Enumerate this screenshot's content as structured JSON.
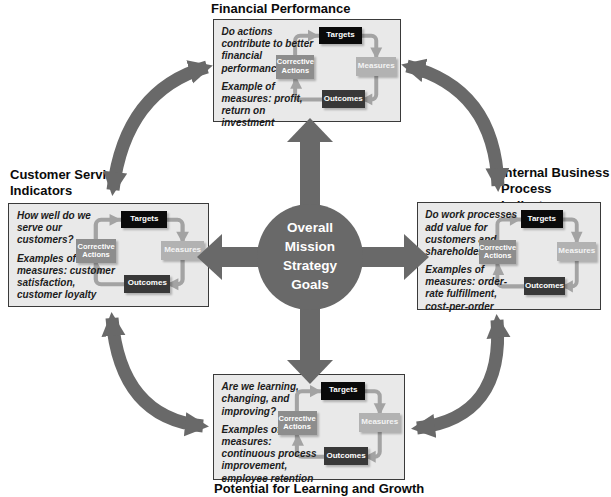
{
  "center": {
    "label": "Overall Mission Strategy Goals",
    "lines": [
      "Overall",
      "Mission",
      "Strategy",
      "Goals"
    ]
  },
  "cycle": {
    "targets": "Targets",
    "measures": "Measures",
    "outcomes": "Outcomes",
    "corrective_actions": "Corrective Actions"
  },
  "panels": {
    "financial": {
      "title": "Financial Performance",
      "question": "Do actions contribute to better financial performance?",
      "examples": "Example of measures: profit, return on investment"
    },
    "customer": {
      "title": "Customer Service Indicators",
      "question": "How well do we serve our customers?",
      "examples": "Examples of measures: customer satisfaction, customer loyalty"
    },
    "internal": {
      "title": "Internal Business Process Indicators",
      "question": "Do work processes add value for customers and shareholders?",
      "examples": "Examples of measures: order-rate fulfillment, cost-per-order"
    },
    "learning": {
      "title": "Potential for Learning and Growth",
      "question": "Are we learning, changing, and improving?",
      "examples": "Examples of measures: continuous process improvement, employee retention"
    }
  },
  "connections": [
    {
      "between": [
        "financial",
        "internal"
      ],
      "bidirectional": true
    },
    {
      "between": [
        "internal",
        "learning"
      ],
      "bidirectional": true
    },
    {
      "between": [
        "learning",
        "customer"
      ],
      "bidirectional": true
    },
    {
      "between": [
        "customer",
        "financial"
      ],
      "bidirectional": true
    },
    {
      "from": "center",
      "to": [
        "financial",
        "customer",
        "internal",
        "learning"
      ]
    }
  ],
  "colors": {
    "arrow_gray": "#696969",
    "loop_gray": "#a3a3a3",
    "panel_bg": "#e9e9e9",
    "panel_border": "#3a3a3a",
    "targets_bg": "#0a0a0a",
    "measures_bg": "#b2b2b2",
    "outcomes_bg": "#383838",
    "corrective_bg": "#8d8d8d"
  }
}
